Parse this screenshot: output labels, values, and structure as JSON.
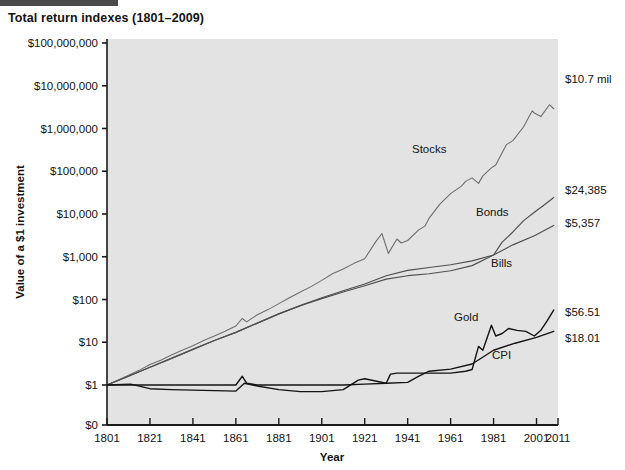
{
  "figure": {
    "title": "Total return indexes (1801–2009)",
    "accent_bar_color": "#4a4a4a",
    "plot_background": "#e3e3e3",
    "axis_color": "#1a1a1a"
  },
  "chart_data": {
    "type": "line",
    "title": "Total return indexes (1801–2009)",
    "xlabel": "Year",
    "ylabel": "Value of a $1 investment",
    "xlim": [
      1801,
      2011
    ],
    "ylim_log": [
      1,
      100000000
    ],
    "yscale": "log",
    "grid": false,
    "legend": "inline-annotations",
    "xticks": [
      1801,
      1821,
      1841,
      1861,
      1881,
      1901,
      1921,
      1941,
      1961,
      1981,
      2001,
      2011
    ],
    "xtick_labels": [
      "1801",
      "1821",
      "1841",
      "1861",
      "1881",
      "1901",
      "1921",
      "1941",
      "1961",
      "1981",
      "2001",
      "2011"
    ],
    "yticks": [
      0,
      1,
      10,
      100,
      1000,
      10000,
      100000,
      1000000,
      10000000,
      100000000
    ],
    "ytick_labels": [
      "$0",
      "$1",
      "$10",
      "$100",
      "$1,000",
      "$10,000",
      "$100,000",
      "$1,000,000",
      "$10,000,000",
      "$100,000,000"
    ],
    "series": [
      {
        "name": "Stocks",
        "color": "#6e6e6e",
        "width": 1.1,
        "end_value_label": "$10.7 mil",
        "end_value": 10700000,
        "x": [
          1801,
          1806,
          1811,
          1816,
          1821,
          1826,
          1831,
          1836,
          1841,
          1846,
          1851,
          1856,
          1861,
          1864,
          1866,
          1871,
          1876,
          1881,
          1886,
          1891,
          1896,
          1901,
          1906,
          1911,
          1916,
          1921,
          1926,
          1929,
          1932,
          1936,
          1938,
          1941,
          1946,
          1949,
          1951,
          1956,
          1961,
          1966,
          1968,
          1971,
          1974,
          1976,
          1980,
          1982,
          1987,
          1990,
          1995,
          1999,
          2000,
          2003,
          2007,
          2009
        ],
        "y": [
          1,
          1.3,
          1.7,
          2.2,
          3.0,
          3.8,
          5.0,
          6.5,
          8.3,
          11,
          14,
          18,
          24,
          36,
          30,
          44,
          58,
          80,
          110,
          150,
          200,
          280,
          400,
          520,
          700,
          900,
          2200,
          3500,
          1200,
          2600,
          2100,
          2400,
          4200,
          5200,
          8000,
          17000,
          30000,
          45000,
          58000,
          70000,
          52000,
          78000,
          120000,
          140000,
          420000,
          520000,
          1100000,
          2600000,
          2300000,
          1900000,
          3600000,
          2900000
        ]
      },
      {
        "name": "Bonds",
        "color": "#4f4f4f",
        "width": 1.2,
        "end_value_label": "$24,385",
        "end_value": 24385,
        "x": [
          1801,
          1811,
          1821,
          1831,
          1841,
          1851,
          1861,
          1871,
          1881,
          1891,
          1901,
          1911,
          1921,
          1931,
          1941,
          1951,
          1961,
          1971,
          1981,
          1985,
          1990,
          1995,
          2000,
          2005,
          2009
        ],
        "y": [
          1,
          1.6,
          2.6,
          4.2,
          6.8,
          11,
          17,
          28,
          46,
          72,
          110,
          160,
          230,
          360,
          480,
          560,
          650,
          800,
          1100,
          2200,
          3800,
          7000,
          11000,
          17000,
          24385
        ]
      },
      {
        "name": "Bills",
        "color": "#4f4f4f",
        "width": 1.2,
        "end_value_label": "$5,357",
        "end_value": 5357,
        "x": [
          1801,
          1811,
          1821,
          1831,
          1841,
          1851,
          1861,
          1871,
          1881,
          1891,
          1901,
          1911,
          1921,
          1931,
          1941,
          1951,
          1961,
          1971,
          1981,
          1990,
          2000,
          2009
        ],
        "y": [
          1,
          1.6,
          2.6,
          4.2,
          6.8,
          11,
          17,
          28,
          46,
          72,
          105,
          150,
          210,
          300,
          360,
          400,
          470,
          620,
          1100,
          1900,
          3100,
          5357
        ]
      },
      {
        "name": "Gold",
        "color": "#141414",
        "width": 1.4,
        "end_value_label": "$56.51",
        "end_value": 56.51,
        "x": [
          1801,
          1821,
          1841,
          1861,
          1864,
          1866,
          1871,
          1881,
          1891,
          1901,
          1911,
          1921,
          1931,
          1933,
          1936,
          1941,
          1951,
          1961,
          1968,
          1971,
          1974,
          1976,
          1980,
          1982,
          1985,
          1988,
          1992,
          1996,
          2000,
          2003,
          2006,
          2009
        ],
        "y": [
          1,
          1,
          1,
          1,
          1.6,
          1.1,
          1,
          1,
          1,
          1,
          1,
          1.05,
          1.1,
          1.8,
          1.9,
          1.9,
          1.9,
          1.9,
          2.1,
          2.3,
          8,
          6.5,
          25,
          14,
          16,
          21,
          19,
          18,
          14,
          19,
          32,
          56.51
        ]
      },
      {
        "name": "CPI",
        "color": "#141414",
        "width": 1.4,
        "end_value_label": "$18.01",
        "end_value": 18.01,
        "x": [
          1801,
          1812,
          1821,
          1831,
          1841,
          1851,
          1861,
          1865,
          1871,
          1881,
          1891,
          1901,
          1911,
          1918,
          1921,
          1931,
          1941,
          1946,
          1951,
          1961,
          1971,
          1981,
          1991,
          2001,
          2009
        ],
        "y": [
          1,
          1.05,
          0.82,
          0.78,
          0.76,
          0.74,
          0.72,
          1.1,
          0.95,
          0.78,
          0.7,
          0.7,
          0.78,
          1.3,
          1.4,
          1.1,
          1.15,
          1.6,
          2.1,
          2.35,
          3.1,
          6.5,
          9.5,
          13.0,
          18.01
        ]
      }
    ],
    "annotations": [
      {
        "text": "Stocks",
        "x_px": 412,
        "y_px": 153
      },
      {
        "text": "Bonds",
        "x_px": 476,
        "y_px": 216
      },
      {
        "text": "Bills",
        "x_px": 491,
        "y_px": 267
      },
      {
        "text": "Gold",
        "x_px": 454,
        "y_px": 321
      },
      {
        "text": "CPI",
        "x_px": 492,
        "y_px": 359
      }
    ],
    "end_labels": [
      {
        "text": "$10.7 mil",
        "x_px": 565,
        "y_px": 83
      },
      {
        "text": "$24,385",
        "x_px": 565,
        "y_px": 194
      },
      {
        "text": "$5,357",
        "x_px": 565,
        "y_px": 227
      },
      {
        "text": "$56.51",
        "x_px": 565,
        "y_px": 316
      },
      {
        "text": "$18.01",
        "x_px": 565,
        "y_px": 342
      }
    ]
  }
}
